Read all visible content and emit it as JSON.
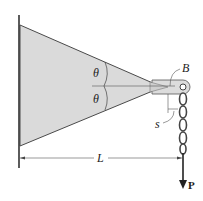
{
  "figure": {
    "type": "engineering-mechanics diagram"
  },
  "labels": {
    "theta_upper": "θ",
    "theta_lower": "θ",
    "point_b": "B",
    "s": "s",
    "length": "L",
    "load": "P"
  },
  "colors": {
    "plate_fill": "#d9d9d9",
    "line": "#3a3a3a",
    "background": "#ffffff"
  }
}
